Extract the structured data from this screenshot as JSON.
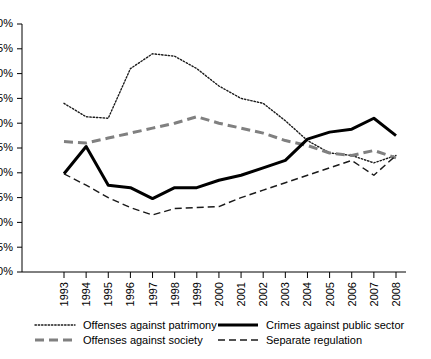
{
  "chart_data": {
    "type": "line",
    "title": "",
    "subtitle": "",
    "xlabel": "",
    "ylabel": "",
    "grid": false,
    "legend_position": "bottom",
    "ylim": [
      0,
      50
    ],
    "ytick_labels": [
      "0%",
      "5%",
      "10%",
      "15%",
      "20%",
      "25%",
      "30%",
      "35%",
      "40%",
      "45%",
      "50%"
    ],
    "ytick_values": [
      0,
      5,
      10,
      15,
      20,
      25,
      30,
      35,
      40,
      45,
      50
    ],
    "categories": [
      "1993",
      "1994",
      "1995",
      "1996",
      "1997",
      "1998",
      "1999",
      "2000",
      "2001",
      "2002",
      "2003",
      "2004",
      "2005",
      "2006",
      "2007",
      "2008"
    ],
    "x": [
      1993,
      1994,
      1995,
      1996,
      1997,
      1998,
      1999,
      2000,
      2001,
      2002,
      2003,
      2004,
      2005,
      2006,
      2007,
      2008
    ],
    "series": [
      {
        "name": "Offenses against patrimony",
        "style": "dotted",
        "color": "#1a1a1a",
        "width": 1.4,
        "values": [
          34.0,
          31.3,
          31.0,
          41.0,
          44.0,
          43.5,
          41.0,
          37.5,
          35.0,
          34.0,
          30.5,
          26.5,
          24.0,
          23.5,
          22.0,
          23.5
        ]
      },
      {
        "name": "Offenses against society",
        "style": "dashed-thick",
        "color": "#808080",
        "width": 3.0,
        "values": [
          26.3,
          26.0,
          27.0,
          28.0,
          29.0,
          30.0,
          31.3,
          30.0,
          29.0,
          28.0,
          26.5,
          25.5,
          24.0,
          23.5,
          24.5,
          23.0
        ]
      },
      {
        "name": "Crimes against public sector",
        "style": "solid",
        "color": "#000000",
        "width": 3.0,
        "values": [
          19.8,
          25.3,
          17.5,
          17.0,
          14.8,
          17.0,
          17.0,
          18.5,
          19.5,
          21.0,
          22.5,
          26.8,
          28.2,
          28.8,
          31.0,
          27.5
        ]
      },
      {
        "name": "Separate regulation",
        "style": "dashed-thin",
        "color": "#1a1a1a",
        "width": 1.4,
        "values": [
          19.8,
          17.5,
          15.0,
          13.0,
          11.5,
          12.8,
          13.0,
          13.2,
          15.0,
          16.5,
          18.0,
          19.5,
          21.0,
          22.5,
          19.5,
          23.5
        ]
      }
    ]
  },
  "legend": {
    "items": [
      {
        "label": "Offenses against patrimony",
        "style": "dotted"
      },
      {
        "label": "Crimes against public sector",
        "style": "solid"
      },
      {
        "label": "Offenses against society",
        "style": "dashed-thick"
      },
      {
        "label": "Separate regulation",
        "style": "dashed-thin"
      }
    ]
  }
}
